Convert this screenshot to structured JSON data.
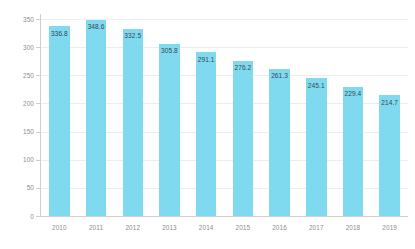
{
  "chart_data": {
    "type": "bar",
    "title": "",
    "subtitle": "",
    "xlabel": "",
    "ylabel": "Average selling price in U.S. dollars",
    "categories": [
      "2010",
      "2011",
      "2012",
      "2013",
      "2014",
      "2015",
      "2016",
      "2017",
      "2018",
      "2019"
    ],
    "values": [
      336.8,
      348.6,
      332.5,
      305.8,
      291.1,
      276.2,
      261.3,
      245.1,
      229.4,
      214.7
    ],
    "value_labels": [
      "336.8",
      "348.6",
      "332.5",
      "305.8",
      "291.1",
      "276.2",
      "261.3",
      "245.1",
      "229.4",
      "214.7"
    ],
    "ylim": [
      0,
      350
    ],
    "ytick_values": [
      0,
      50,
      100,
      150,
      200,
      250,
      300,
      350
    ],
    "ytick_labels": [
      "0",
      "50",
      "100",
      "150",
      "200",
      "250",
      "300",
      "350"
    ],
    "grid": "horizontal",
    "legend": "none",
    "bar_color": "#7fdaf0",
    "grid_color": "#ededee",
    "axis_color": "#cfcfd1",
    "tick_label_color": "#8d8d8d",
    "value_label_color": "#3c4653",
    "background_color": "#ffffff"
  }
}
